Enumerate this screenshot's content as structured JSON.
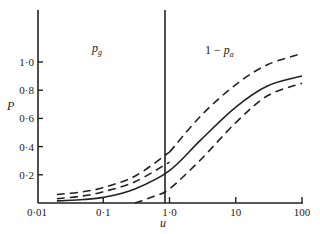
{
  "chart_data": {
    "type": "line",
    "title": "",
    "xlabel": "u",
    "ylabel": "P",
    "xscale": "log",
    "xlim": [
      0.01,
      100
    ],
    "ylim": [
      0,
      1.1
    ],
    "grid": false,
    "x_ticks": [
      0.01,
      0.1,
      1.0,
      10,
      100
    ],
    "x_tick_labels": [
      "0·01",
      "0·1",
      "1·0",
      "10",
      "100"
    ],
    "y_ticks": [
      0.2,
      0.4,
      0.6,
      0.8,
      1.0
    ],
    "y_tick_labels": [
      "0·2",
      "0·4",
      "0·6",
      "0·8",
      "1·0"
    ],
    "annotations": [
      {
        "text_main": "p",
        "text_sub": "g",
        "prefix": "",
        "position": "left of u=1"
      },
      {
        "text_main": "p",
        "text_sub": "a",
        "prefix": "1 − ",
        "position": "right of u=1"
      }
    ],
    "divider_x": 1.0,
    "series": [
      {
        "name": "upper dashed (left segment)",
        "style": "dashed",
        "x": [
          0.02,
          0.05,
          0.1,
          0.3,
          1.0
        ],
        "y": [
          0.06,
          0.08,
          0.11,
          0.19,
          0.36
        ]
      },
      {
        "name": "upper dashed (right segment)",
        "style": "dashed",
        "x": [
          1.0,
          3.0,
          10,
          30,
          100
        ],
        "y": [
          0.36,
          0.62,
          0.84,
          0.98,
          1.06
        ]
      },
      {
        "name": "middle dashed",
        "style": "dashed",
        "x": [
          0.02,
          0.05,
          0.1,
          0.3,
          1.0
        ],
        "y": [
          0.03,
          0.05,
          0.08,
          0.15,
          0.29
        ]
      },
      {
        "name": "solid",
        "style": "solid",
        "x": [
          0.02,
          0.05,
          0.1,
          0.3,
          1.0,
          3.0,
          10,
          30,
          100
        ],
        "y": [
          0.015,
          0.025,
          0.04,
          0.1,
          0.23,
          0.45,
          0.68,
          0.83,
          0.9
        ]
      },
      {
        "name": "lower dashed",
        "style": "dashed",
        "x": [
          0.3,
          0.6,
          1.0,
          3.0,
          10,
          30,
          100
        ],
        "y": [
          0.0,
          0.05,
          0.1,
          0.31,
          0.57,
          0.76,
          0.85
        ]
      }
    ]
  }
}
